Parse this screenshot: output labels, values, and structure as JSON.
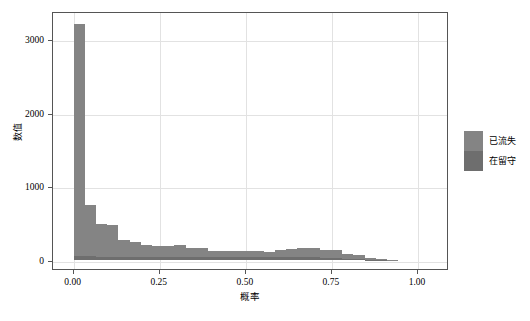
{
  "chart_data": {
    "type": "bar",
    "subtype": "stacked-histogram",
    "title": "",
    "xlabel": "概率",
    "ylabel": "数值",
    "xlim": [
      -0.06,
      1.09
    ],
    "ylim": [
      -120,
      3380
    ],
    "grid": true,
    "legend_position": "right",
    "xticks": [
      "0.00",
      "0.25",
      "0.50",
      "0.75",
      "1.00"
    ],
    "xtick_values": [
      0.0,
      0.25,
      0.5,
      0.75,
      1.0
    ],
    "yticks": [
      "0",
      "1000",
      "2000",
      "3000"
    ],
    "ytick_values": [
      0,
      1000,
      2000,
      3000
    ],
    "bin_width": 0.0325,
    "bin_starts": [
      0.0,
      0.0325,
      0.065,
      0.0975,
      0.13,
      0.1625,
      0.195,
      0.2275,
      0.26,
      0.2925,
      0.325,
      0.3575,
      0.39,
      0.4225,
      0.455,
      0.4875,
      0.52,
      0.5525,
      0.585,
      0.6175,
      0.65,
      0.6825,
      0.715,
      0.7475,
      0.78,
      0.8125,
      0.845,
      0.8775,
      0.91
    ],
    "categories": [
      "0.00",
      "0.03",
      "0.07",
      "0.10",
      "0.13",
      "0.16",
      "0.20",
      "0.23",
      "0.26",
      "0.29",
      "0.33",
      "0.36",
      "0.39",
      "0.42",
      "0.46",
      "0.49",
      "0.52",
      "0.55",
      "0.59",
      "0.62",
      "0.65",
      "0.68",
      "0.72",
      "0.75",
      "0.78",
      "0.81",
      "0.85",
      "0.88",
      "0.91"
    ],
    "series": [
      {
        "name": "已流失",
        "color": "#848484",
        "values": [
          3150,
          690,
          440,
          430,
          230,
          200,
          160,
          150,
          150,
          170,
          130,
          120,
          90,
          80,
          90,
          90,
          80,
          70,
          100,
          110,
          130,
          130,
          100,
          110,
          60,
          50,
          20,
          8,
          4
        ]
      },
      {
        "name": "在留守",
        "color": "#6e6e6e",
        "values": [
          50,
          55,
          45,
          45,
          45,
          45,
          45,
          45,
          45,
          40,
          40,
          40,
          40,
          40,
          40,
          40,
          40,
          40,
          40,
          40,
          40,
          40,
          35,
          30,
          20,
          15,
          8,
          4,
          2
        ]
      }
    ],
    "totals": [
      3200,
      745,
      485,
      475,
      275,
      245,
      205,
      195,
      195,
      210,
      170,
      160,
      130,
      120,
      130,
      130,
      120,
      110,
      140,
      150,
      170,
      170,
      135,
      140,
      80,
      65,
      28,
      12,
      6
    ]
  },
  "legend": {
    "items": [
      {
        "label": "已流失",
        "color": "#848484"
      },
      {
        "label": "在留守",
        "color": "#6e6e6e"
      }
    ]
  }
}
